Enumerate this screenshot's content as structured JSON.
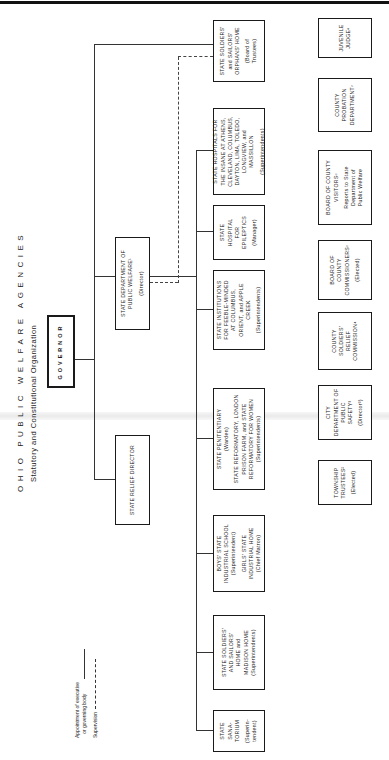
{
  "title": "OHIO PUBLIC WELFARE AGENCIES",
  "subtitle": "Statutory and Constitutional Organization",
  "governor": {
    "label": "GOVERNOR"
  },
  "state_dept": {
    "line1": "STATE DEPARTMENT OF\nPUBLIC WELFARE¹",
    "line2": "(Director)"
  },
  "relief_director": {
    "label": "STATE RELIEF DIRECTOR"
  },
  "legend": {
    "appointment": "Appointment of executive\n   or governing body",
    "supervision": "Supervision"
  },
  "institutions": [
    {
      "id": "orphans-home",
      "name": "STATE SOLDIERS'\nand SAILORS'\nORPHANS' HOME",
      "head": "(Board of\nTrustees)"
    },
    {
      "id": "insane-hospitals",
      "name": "STATE HOSPITALS FOR\nTHE INSANE AT ATHENS,\nCLEVELAND, COLUMBUS,\nDAYTON, LIMA, TOLEDO,\nLONGVIEW, and\nMASSILLON",
      "head": "(Superintendents)"
    },
    {
      "id": "epileptics-hospital",
      "name": "STATE\nHOSPITAL\nFOR\nEPILEPTICS",
      "head": "(Manager)"
    },
    {
      "id": "feeble-minded",
      "name": "STATE INSTITUTIONS\nFOR FEEBLE-MINDED\nAT COLUMBUS,\nORIENT, and APPLE\nCREEK",
      "head": "(Superintendents)"
    },
    {
      "id": "penitentiary",
      "name": "STATE PENITENTIARY",
      "head": "(Warden)",
      "name2": "STATE REFORMATORY, LONDON\nPRISON FARM, and STATE\nREFORMATORY FOR WOMEN",
      "head2": "(Superintendents)"
    },
    {
      "id": "industrial-schools",
      "name": "BOYS' STATE\nINDUSTRIAL SCHOOL",
      "head": "(Superintendent)",
      "name2": "GIRLS' STATE\nINDUSTRIAL HOME",
      "head2": "(Chief Matron)"
    },
    {
      "id": "soldiers-home",
      "name": "STATE SOLDIERS'\nAND SAILORS'\nHOME and\nMADISON HOME",
      "head": "(Superintendents)"
    },
    {
      "id": "sanatorium",
      "name": "STATE\nSANA-\nTORIUM",
      "head": "(Superin-\ntendent)"
    }
  ],
  "local_agencies": [
    {
      "id": "juvenile-judge",
      "name": "JUVENILE\nJUDGE⁸"
    },
    {
      "id": "probation-dept",
      "name": "COUNTY\nPROBATION\nDEPARTMENT⁷"
    },
    {
      "id": "county-visitors",
      "name": "BOARD OF COUNTY\nVISITORS⁶",
      "note": "Reports to State\nDepartment of\nPublic Welfare"
    },
    {
      "id": "county-commissioners",
      "name": "BOARD OF\nCOUNTY\nCOMMISSIONERS⁵",
      "note": "(Elected)"
    },
    {
      "id": "soldiers-relief",
      "name": "COUNTY\nSOLDIERS'\nRELIEF\nCOMMISSION⁴"
    },
    {
      "id": "city-safety",
      "name": "CITY\nDEPARTMENT OF\nPUBLIC\nSAFETY³",
      "note": "(Director³)"
    },
    {
      "id": "township-trustees",
      "name": "TOWNSHIP\nTRUSTEES²",
      "note": "(Elected)"
    }
  ]
}
